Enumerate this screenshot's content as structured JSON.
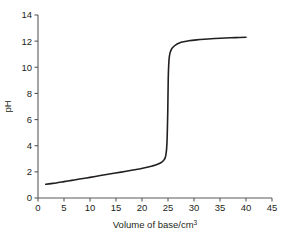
{
  "chart_data": {
    "type": "line",
    "title": "",
    "subtitle": "",
    "xlabel": "Volume of base/cm",
    "xlabel_superscript": "3",
    "xlabel_full": "Volume of base/cm3",
    "ylabel": "pH",
    "xlim": [
      0,
      45
    ],
    "ylim": [
      0,
      14
    ],
    "xticks": [
      "0",
      "5",
      "10",
      "15",
      "20",
      "25",
      "30",
      "35",
      "40",
      "45"
    ],
    "xtick_values": [
      0,
      5,
      10,
      15,
      20,
      25,
      30,
      35,
      40,
      45
    ],
    "yticks": [
      "0",
      "2",
      "4",
      "6",
      "8",
      "10",
      "12",
      "14"
    ],
    "ytick_values": [
      0,
      2,
      4,
      6,
      8,
      10,
      12,
      14
    ],
    "grid": false,
    "legend": null,
    "legend_position": "none",
    "series": [
      {
        "name": "Titration curve",
        "color": "#231f20",
        "line_width": 1.6,
        "x": [
          1.5,
          2.5,
          3.5,
          5.0,
          6.5,
          8.0,
          10.0,
          12.0,
          14.0,
          16.0,
          18.0,
          19.5,
          21.0,
          22.0,
          23.0,
          23.8,
          24.3,
          24.6,
          24.8,
          24.95,
          25.05,
          25.2,
          25.4,
          25.7,
          26.0,
          26.5,
          27.2,
          28.0,
          29.0,
          30.5,
          32.0,
          34.0,
          36.0,
          38.0,
          40.0
        ],
        "y": [
          1.05,
          1.1,
          1.15,
          1.25,
          1.35,
          1.45,
          1.58,
          1.72,
          1.85,
          1.98,
          2.12,
          2.22,
          2.35,
          2.45,
          2.58,
          2.75,
          2.95,
          3.3,
          4.2,
          6.5,
          9.2,
          10.6,
          11.1,
          11.4,
          11.55,
          11.72,
          11.86,
          11.95,
          12.03,
          12.1,
          12.15,
          12.2,
          12.24,
          12.27,
          12.3
        ]
      }
    ],
    "annotations": [],
    "axis_color": "#58595b",
    "background": "#ffffff"
  },
  "plot_geometry": {
    "origin_x_px": 38,
    "origin_y_px": 198,
    "x_max_px": 272,
    "y_top_px": 15
  }
}
